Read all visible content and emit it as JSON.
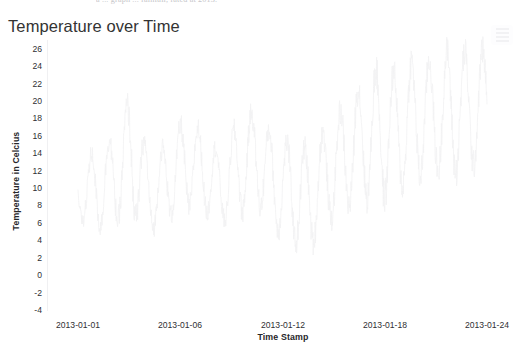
{
  "page": {
    "background_color": "#ffffff",
    "clipped_text_above": "a ... graph ... rainfall, rated at 2013."
  },
  "chart": {
    "title": "Temperature over Time",
    "title_color": "#333333",
    "menu_button": {
      "name": "context-menu-button",
      "icon": "hamburger-icon",
      "color": "#f2f2f4"
    },
    "series_color": "#f2f2f3",
    "axis_line_color": "#f0f0f2"
  },
  "chart_data": {
    "type": "line",
    "title": "Temperature over Time",
    "xlabel": "Time Stamp",
    "ylabel": "Temperature in Celcius",
    "ylim": [
      -4,
      27
    ],
    "grid": false,
    "legend": false,
    "y_ticks": [
      26,
      24,
      22,
      20,
      18,
      16,
      14,
      12,
      10,
      8,
      6,
      4,
      2,
      0,
      -2,
      -4
    ],
    "x_ticks": [
      "2013-01-01",
      "2013-01-06",
      "2013-01-12",
      "2013-01-18",
      "2013-01-24"
    ],
    "x_range": [
      "2013-01-01",
      "2013-01-24"
    ],
    "series": [
      {
        "name": "Temperature",
        "color": "#f2f2f3",
        "x": [
          "2013-01-01",
          "2013-01-02",
          "2013-01-03",
          "2013-01-04",
          "2013-01-05",
          "2013-01-06",
          "2013-01-07",
          "2013-01-08",
          "2013-01-09",
          "2013-01-10",
          "2013-01-11",
          "2013-01-12",
          "2013-01-13",
          "2013-01-14",
          "2013-01-15",
          "2013-01-16",
          "2013-01-17",
          "2013-01-18",
          "2013-01-19",
          "2013-01-20",
          "2013-01-21",
          "2013-01-22",
          "2013-01-23",
          "2013-01-24"
        ],
        "daily_min": [
          6.5,
          5.5,
          6.0,
          7.0,
          5.0,
          6.5,
          8.0,
          7.5,
          6.0,
          7.0,
          8.5,
          5.5,
          4.0,
          3.0,
          6.0,
          7.5,
          9.0,
          8.5,
          10.0,
          11.0,
          12.0,
          11.5,
          12.5,
          13.0
        ],
        "daily_max": [
          12.0,
          14.5,
          16.0,
          20.5,
          13.5,
          15.0,
          18.0,
          16.5,
          14.0,
          17.5,
          19.0,
          16.0,
          15.0,
          14.5,
          17.0,
          19.5,
          22.0,
          24.0,
          23.0,
          25.0,
          24.5,
          26.0,
          25.5,
          26.0
        ],
        "values_note": "High-frequency diurnal oscillation sampled roughly every 30 minutes; amplitude grows and baseline rises across the month."
      }
    ]
  }
}
